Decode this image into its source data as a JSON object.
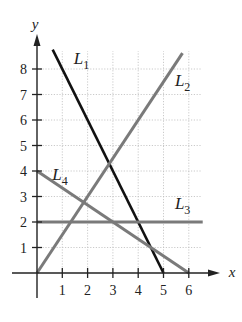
{
  "chart_data": {
    "type": "line",
    "title": "",
    "xlabel": "x",
    "ylabel": "y",
    "xlim": [
      0,
      6.5
    ],
    "ylim": [
      0,
      8.7
    ],
    "x_ticks": [
      1,
      2,
      3,
      4,
      5,
      6
    ],
    "y_ticks": [
      1,
      2,
      3,
      4,
      5,
      6,
      7,
      8
    ],
    "grid": true,
    "series": [
      {
        "name": "L1",
        "sub": "1",
        "color": "#111111",
        "width": 2.6,
        "x": [
          0.62,
          5
        ],
        "y": [
          8.76,
          0
        ],
        "equation": "y = -2x + 10",
        "label_pos": [
          1.45,
          8.2
        ]
      },
      {
        "name": "L2",
        "sub": "2",
        "color": "#7a7a7a",
        "width": 3,
        "x": [
          0,
          5.75
        ],
        "y": [
          0,
          8.62
        ],
        "equation": "y = 1.5x",
        "label_pos": [
          5.45,
          7.35
        ]
      },
      {
        "name": "L3",
        "sub": "3",
        "color": "#7a7a7a",
        "width": 3,
        "x": [
          0,
          6.55
        ],
        "y": [
          2,
          2
        ],
        "equation": "y = 2",
        "label_pos": [
          5.45,
          2.5
        ]
      },
      {
        "name": "L4",
        "sub": "4",
        "color": "#7a7a7a",
        "width": 3,
        "x": [
          0,
          6
        ],
        "y": [
          4,
          0
        ],
        "equation": "y = 4 - (2/3)x",
        "label_pos": [
          0.6,
          3.65
        ]
      }
    ]
  }
}
